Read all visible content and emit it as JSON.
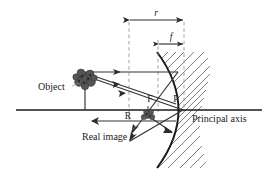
{
  "figure": {
    "labels": {
      "object": "Object",
      "real_image": "Real image",
      "principal_axis": "Principal axis",
      "focus": "F",
      "pole": "P",
      "center_of_curvature": "R",
      "radius_dimension": "r",
      "focal_dimension": "f"
    },
    "colors": {
      "ink": "#1a1a1a",
      "ray": "#333333",
      "dashed": "#8a8a8a",
      "hatch": "#4a4a4a",
      "background": "#ffffff"
    },
    "geometry": {
      "principal_axis_y": 110,
      "axis_x_start": 16,
      "axis_x_end": 262,
      "pole_x": 184,
      "focus_x": 158,
      "center_x": 129,
      "object_x": 85,
      "object_top_y": 72,
      "image_x": 148,
      "image_y": 115,
      "mirror_top": [
        157,
        52
      ],
      "mirror_bottom": [
        157,
        168
      ]
    }
  }
}
